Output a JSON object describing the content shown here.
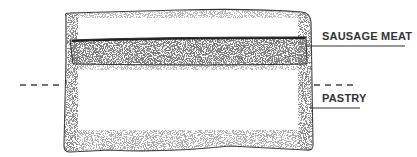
{
  "diagram": {
    "labels": {
      "sausage_meat": "SAUSAGE MEAT",
      "pastry": "PASTRY"
    },
    "colors": {
      "ink": "#333333",
      "background": "#ffffff"
    }
  }
}
